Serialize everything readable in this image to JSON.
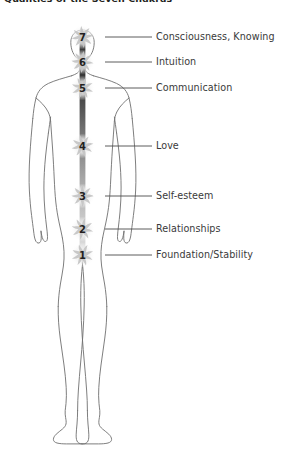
{
  "figure": {
    "title": "Qualities of the Seven Chakras",
    "background_color": "#ffffff",
    "body_outline_color": "#6f6f6f",
    "leader_line_color": "#4a4a4a",
    "label_text_color": "#3a3a3a",
    "chakra_glyph_color": "#c9c9c9",
    "spine_gradient": [
      "#5a5a5a",
      "#3f3f3f",
      "#6e6e6e",
      "#9a9a9a",
      "#c4c4c4",
      "#dcdcdc"
    ]
  },
  "chart_data": {
    "type": "diagram",
    "title": "Qualities of the Seven Chakras",
    "xlabel": "",
    "ylabel": "",
    "grid": false,
    "legend": "none",
    "categories": [
      "7",
      "6",
      "5",
      "4",
      "3",
      "2",
      "1"
    ],
    "values": [
      7,
      6,
      5,
      4,
      3,
      2,
      1
    ],
    "annotations": [
      "Consciousness, Knowing",
      "Intuition",
      "Communication",
      "Love",
      "Self-esteem",
      "Relationships",
      "Foundation/Stability"
    ]
  },
  "chakras": [
    {
      "number": "7",
      "label": "Consciousness, Knowing",
      "y": 37,
      "label_x": 156,
      "line_x1": 105,
      "line_x2": 152
    },
    {
      "number": "6",
      "label": "Intuition",
      "y": 62,
      "label_x": 156,
      "line_x1": 105,
      "line_x2": 152
    },
    {
      "number": "5",
      "label": "Communication",
      "y": 88,
      "label_x": 156,
      "line_x1": 105,
      "line_x2": 152
    },
    {
      "number": "4",
      "label": "Love",
      "y": 146,
      "label_x": 156,
      "line_x1": 105,
      "line_x2": 152
    },
    {
      "number": "3",
      "label": "Self-esteem",
      "y": 196,
      "label_x": 156,
      "line_x1": 105,
      "line_x2": 152
    },
    {
      "number": "2",
      "label": "Relationships",
      "y": 229,
      "label_x": 156,
      "line_x1": 105,
      "line_x2": 152
    },
    {
      "number": "1",
      "label": "Foundation/Stability",
      "y": 255,
      "label_x": 156,
      "line_x1": 105,
      "line_x2": 152
    }
  ]
}
